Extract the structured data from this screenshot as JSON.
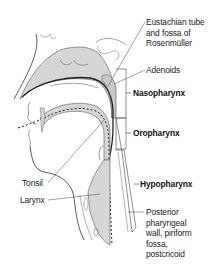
{
  "diagram": {
    "colors": {
      "tissue_fill": "#d4d4d4",
      "outline": "#333333",
      "background": "#ffffff",
      "airway": "#222222"
    },
    "labels": {
      "eustachian": [
        "Eustachian tube",
        "and fossa of",
        "Rosenmüller"
      ],
      "adenoids": "Adenoids",
      "nasopharynx": "Nasopharynx",
      "oropharynx": "Oropharynx",
      "tonsil": "Tonsil",
      "larynx": "Larynx",
      "hypopharynx": "Hypopharynx",
      "posterior": [
        "Posterior",
        "pharyngeal",
        "wall, piriform",
        "fossa,",
        "postcricoid"
      ]
    },
    "regions": [
      {
        "name": "Nasopharynx",
        "bracket_y": [
          69,
          118
        ]
      },
      {
        "name": "Oropharynx",
        "bracket_y": [
          118,
          149
        ]
      },
      {
        "name": "Hypopharynx",
        "bracket_y": [
          149,
          225
        ]
      }
    ]
  }
}
